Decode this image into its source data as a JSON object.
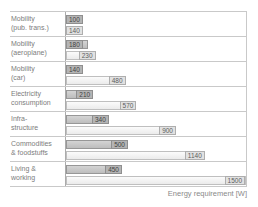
{
  "chart_data": {
    "type": "bar",
    "orientation": "horizontal",
    "title": "",
    "xlabel": "Energy requirement [W]",
    "xlim": [
      0,
      1500
    ],
    "grid": "boxed plot area with horizontal separator line between each category group",
    "legend": "none",
    "value_labels_shown": true,
    "categories": [
      "Mobility (pub. trans.)",
      "Mobility (aeroplane)",
      "Mobility (car)",
      "Electricity consumption",
      "Infra-structure",
      "Commodities & foodstuffs",
      "Living & working"
    ],
    "category_lines": [
      [
        "Mobility",
        "(pub. trans.)"
      ],
      [
        "Mobility",
        "(aeroplane)"
      ],
      [
        "Mobility",
        "(car)"
      ],
      [
        "Electricity",
        "consumption"
      ],
      [
        "Infra-",
        "structure"
      ],
      [
        "Commodities",
        "& foodstuffs"
      ],
      [
        "Living &",
        "working"
      ]
    ],
    "series": [
      {
        "name": "upper-dark-gray-bar",
        "values": [
          100,
          180,
          140,
          210,
          340,
          500,
          450
        ]
      },
      {
        "name": "lower-light-gray-bar",
        "values": [
          140,
          230,
          480,
          570,
          900,
          1140,
          1500
        ]
      }
    ]
  },
  "colors": {
    "background": "#ffffff",
    "grid_line": "#c9c9c9",
    "axis_line": "#ababab",
    "dark_bar_fill": "#c6c6c6",
    "dark_bar_border": "#979797",
    "dark_value_box": "#b4b4b4",
    "light_bar_fill": "#f2f2f2",
    "light_bar_border": "#bfbfbf",
    "light_value_box": "#e1e1e1",
    "category_text": "#7c7c7c",
    "value_text_dark_bar": "#424242",
    "value_text_light_bar": "#5d5d5d",
    "axis_label_text": "#8a8a8a"
  }
}
